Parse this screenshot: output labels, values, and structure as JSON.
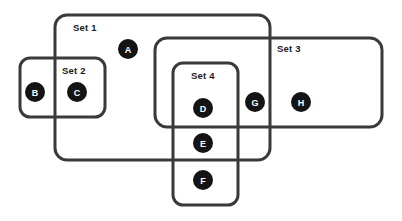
{
  "diagram": {
    "type": "euler-set-diagram",
    "background_color": "#ffffff",
    "stroke_color": "#3a3a3a",
    "stroke_width": 3,
    "node_fill_color": "#141414",
    "node_text_color": "#ffffff",
    "label_text_color": "#1a1a1a",
    "sets": [
      {
        "id": "set1",
        "label": "Set 1",
        "x": 55,
        "y": 15,
        "width": 215,
        "height": 145,
        "corner_radius": 12,
        "label_x": 73,
        "label_y": 31,
        "members": [
          "A",
          "C"
        ]
      },
      {
        "id": "set2",
        "label": "Set 2",
        "x": 20,
        "y": 58,
        "width": 85,
        "height": 59,
        "corner_radius": 10,
        "label_x": 62,
        "label_y": 74,
        "members": [
          "B",
          "C"
        ]
      },
      {
        "id": "set3",
        "label": "Set 3",
        "x": 155,
        "y": 38,
        "width": 227,
        "height": 89,
        "corner_radius": 12,
        "label_x": 277,
        "label_y": 52,
        "members": [
          "D",
          "G",
          "H"
        ]
      },
      {
        "id": "set4",
        "label": "Set 4",
        "x": 173,
        "y": 63,
        "width": 65,
        "height": 142,
        "corner_radius": 10,
        "label_x": 191,
        "label_y": 79,
        "members": [
          "D",
          "E",
          "F"
        ]
      }
    ],
    "nodes": [
      {
        "id": "A",
        "label": "A",
        "cx": 128,
        "cy": 49,
        "r": 10
      },
      {
        "id": "B",
        "label": "B",
        "cx": 35,
        "cy": 92,
        "r": 10
      },
      {
        "id": "C",
        "label": "C",
        "cx": 77,
        "cy": 92,
        "r": 10
      },
      {
        "id": "D",
        "label": "D",
        "cx": 203,
        "cy": 108,
        "r": 10
      },
      {
        "id": "E",
        "label": "E",
        "cx": 203,
        "cy": 143,
        "r": 10
      },
      {
        "id": "F",
        "label": "F",
        "cx": 203,
        "cy": 180,
        "r": 10
      },
      {
        "id": "G",
        "label": "G",
        "cx": 255,
        "cy": 102,
        "r": 10
      },
      {
        "id": "H",
        "label": "H",
        "cx": 301,
        "cy": 102,
        "r": 10
      }
    ]
  }
}
